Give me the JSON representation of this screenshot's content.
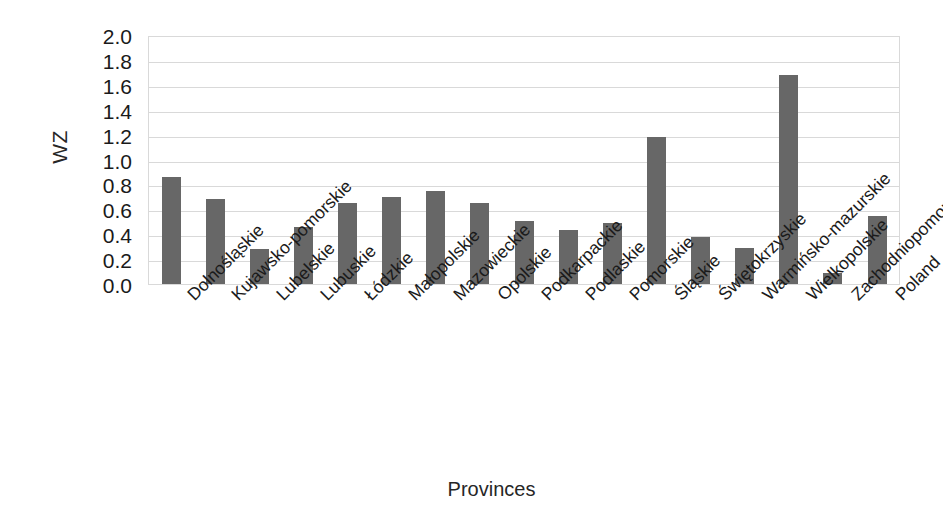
{
  "chart_data": {
    "type": "bar",
    "title": "",
    "xlabel": "Provinces",
    "ylabel": "WZ",
    "ylim": [
      0.0,
      2.0
    ],
    "ytick_step": 0.2,
    "grid": true,
    "legend": "none",
    "bar_color": "#676767",
    "gridline_color": "#d9d9d9",
    "plot_border_color": "#d9d9d9",
    "ytick_labels": [
      "2.0",
      "1.8",
      "1.6",
      "1.4",
      "1.2",
      "1.0",
      "0.8",
      "0.6",
      "0.4",
      "0.2",
      "0.0"
    ],
    "ytick_values": [
      2.0,
      1.8,
      1.6,
      1.4,
      1.2,
      1.0,
      0.8,
      0.6,
      0.4,
      0.2,
      0.0
    ],
    "categories": [
      "Dolnośląskie",
      "Kujawsko-pomorskie",
      "Lubelskie",
      "Lubuskie",
      "Łódzkie",
      "Małopolskie",
      "Mazowieckie",
      "Opolskie",
      "Podkarpackie",
      "Podlaskie",
      "Pomorskie",
      "Śląskie",
      "Świętokrzyskie",
      "Warmińsko-mazurskie",
      "Wielkopolskie",
      "Zachodniopomorskie",
      "Poland"
    ],
    "values": [
      0.86,
      0.68,
      0.28,
      0.46,
      0.65,
      0.7,
      0.75,
      0.65,
      0.51,
      0.43,
      0.49,
      1.18,
      0.38,
      0.29,
      1.68,
      0.09,
      0.55
    ]
  }
}
